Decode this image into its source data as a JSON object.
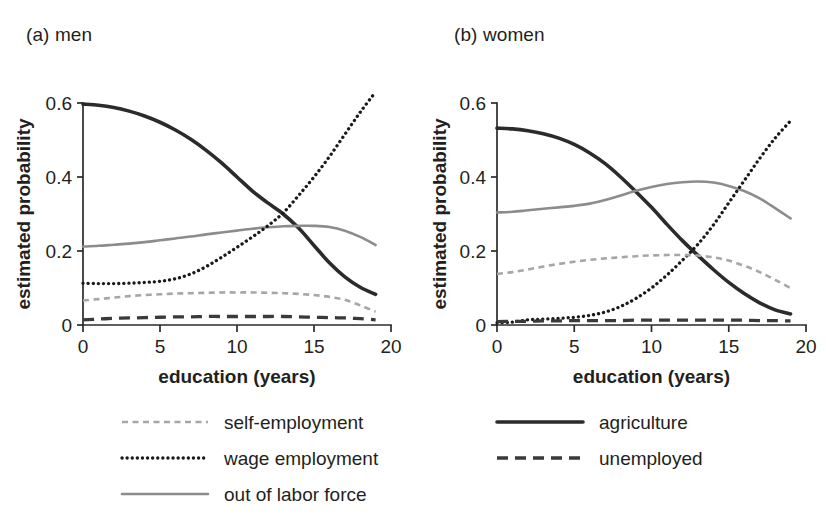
{
  "figure": {
    "panel_a_title": "(a) men",
    "panel_b_title": "(b) women"
  },
  "legend": {
    "left_items": [
      {
        "label": "self-employment",
        "style": "short-dash",
        "color": "#a6a6a6"
      },
      {
        "label": "wage employment",
        "style": "dotted",
        "color": "#1a1a1a"
      },
      {
        "label": "out of labor force",
        "style": "solid-thin",
        "color": "#8c8c8c"
      }
    ],
    "right_items": [
      {
        "label": "agriculture",
        "style": "solid-thick",
        "color": "#2b2b2b"
      },
      {
        "label": "unemployed",
        "style": "long-dash",
        "color": "#3a3a3a"
      }
    ]
  },
  "chart_data": [
    {
      "type": "line",
      "id": "men",
      "title": "(a) men",
      "xlabel": "education (years)",
      "ylabel": "estimated probability",
      "xlim": [
        0,
        20
      ],
      "ylim": [
        0,
        0.6
      ],
      "xticks": [
        0,
        5,
        10,
        15,
        20
      ],
      "xticklabels": [
        "0",
        "5",
        "10",
        "15",
        "20"
      ],
      "yticks": [
        0,
        0.2,
        0.4,
        0.6
      ],
      "yticklabels": [
        "0",
        "0.2",
        "0.4",
        "0.6"
      ],
      "grid": false,
      "legend_position": "below-figure",
      "x": [
        0,
        1,
        2,
        3,
        4,
        5,
        6,
        7,
        8,
        9,
        10,
        11,
        12,
        13,
        14,
        15,
        16,
        17,
        18,
        19
      ],
      "series": [
        {
          "name": "agriculture",
          "style": "solid-thick",
          "color": "#2b2b2b",
          "values": [
            0.597,
            0.594,
            0.588,
            0.578,
            0.565,
            0.548,
            0.527,
            0.502,
            0.472,
            0.438,
            0.4,
            0.362,
            0.33,
            0.3,
            0.262,
            0.215,
            0.168,
            0.13,
            0.102,
            0.083
          ]
        },
        {
          "name": "out of labor force",
          "style": "solid-thin",
          "color": "#8c8c8c",
          "values": [
            0.212,
            0.214,
            0.217,
            0.22,
            0.224,
            0.229,
            0.234,
            0.239,
            0.245,
            0.25,
            0.255,
            0.26,
            0.264,
            0.267,
            0.268,
            0.268,
            0.265,
            0.255,
            0.238,
            0.216
          ]
        },
        {
          "name": "wage employment",
          "style": "dotted",
          "color": "#1a1a1a",
          "values": [
            0.113,
            0.112,
            0.112,
            0.113,
            0.115,
            0.118,
            0.125,
            0.138,
            0.158,
            0.183,
            0.21,
            0.238,
            0.268,
            0.303,
            0.35,
            0.4,
            0.455,
            0.515,
            0.575,
            0.63
          ]
        },
        {
          "name": "self-employment",
          "style": "short-dash",
          "color": "#a6a6a6",
          "values": [
            0.066,
            0.07,
            0.074,
            0.078,
            0.081,
            0.083,
            0.085,
            0.086,
            0.087,
            0.088,
            0.088,
            0.088,
            0.087,
            0.086,
            0.084,
            0.081,
            0.076,
            0.068,
            0.053,
            0.036
          ]
        },
        {
          "name": "unemployed",
          "style": "long-dash",
          "color": "#3a3a3a",
          "values": [
            0.014,
            0.016,
            0.018,
            0.019,
            0.02,
            0.021,
            0.022,
            0.022,
            0.023,
            0.023,
            0.023,
            0.023,
            0.023,
            0.023,
            0.022,
            0.021,
            0.02,
            0.019,
            0.017,
            0.014
          ]
        }
      ]
    },
    {
      "type": "line",
      "id": "women",
      "title": "(b) women",
      "xlabel": "education (years)",
      "ylabel": "estimated probability",
      "xlim": [
        0,
        20
      ],
      "ylim": [
        0,
        0.6
      ],
      "xticks": [
        0,
        5,
        10,
        15,
        20
      ],
      "xticklabels": [
        "0",
        "5",
        "10",
        "15",
        "20"
      ],
      "yticks": [
        0,
        0.2,
        0.4,
        0.6
      ],
      "yticklabels": [
        "0",
        "0.2",
        "0.4",
        "0.6"
      ],
      "grid": false,
      "legend_position": "below-figure",
      "x": [
        0,
        1,
        2,
        3,
        4,
        5,
        6,
        7,
        8,
        9,
        10,
        11,
        12,
        13,
        14,
        15,
        16,
        17,
        18,
        19
      ],
      "series": [
        {
          "name": "agriculture",
          "style": "solid-thick",
          "color": "#2b2b2b",
          "values": [
            0.532,
            0.53,
            0.525,
            0.517,
            0.505,
            0.488,
            0.465,
            0.436,
            0.4,
            0.36,
            0.318,
            0.272,
            0.228,
            0.188,
            0.15,
            0.115,
            0.085,
            0.06,
            0.041,
            0.03
          ]
        },
        {
          "name": "out of labor force",
          "style": "solid-thin",
          "color": "#8c8c8c",
          "values": [
            0.304,
            0.306,
            0.31,
            0.314,
            0.318,
            0.322,
            0.328,
            0.338,
            0.35,
            0.363,
            0.373,
            0.381,
            0.386,
            0.388,
            0.385,
            0.376,
            0.362,
            0.342,
            0.316,
            0.288
          ]
        },
        {
          "name": "wage employment",
          "style": "dotted",
          "color": "#1a1a1a",
          "values": [
            0.006,
            0.008,
            0.014,
            0.016,
            0.018,
            0.021,
            0.026,
            0.035,
            0.05,
            0.072,
            0.1,
            0.135,
            0.175,
            0.218,
            0.27,
            0.33,
            0.39,
            0.45,
            0.505,
            0.552
          ]
        },
        {
          "name": "self-employment",
          "style": "short-dash",
          "color": "#a6a6a6",
          "values": [
            0.138,
            0.143,
            0.15,
            0.158,
            0.165,
            0.171,
            0.176,
            0.18,
            0.183,
            0.186,
            0.188,
            0.189,
            0.189,
            0.188,
            0.183,
            0.174,
            0.16,
            0.143,
            0.122,
            0.1
          ]
        },
        {
          "name": "unemployed",
          "style": "long-dash",
          "color": "#3a3a3a",
          "values": [
            0.009,
            0.01,
            0.01,
            0.011,
            0.011,
            0.012,
            0.012,
            0.012,
            0.012,
            0.013,
            0.013,
            0.013,
            0.013,
            0.013,
            0.013,
            0.013,
            0.013,
            0.012,
            0.012,
            0.011
          ]
        }
      ]
    }
  ]
}
